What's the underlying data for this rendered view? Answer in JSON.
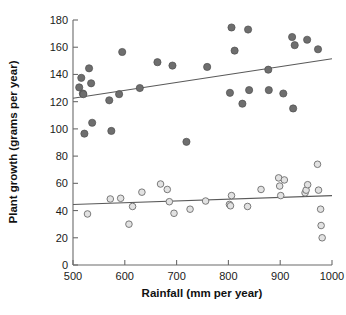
{
  "chart_data": {
    "type": "scatter",
    "title": "",
    "xlabel": "Rainfall (mm per year)",
    "ylabel": "Plant growth (grams per year)",
    "xlim": [
      500,
      1000
    ],
    "ylim": [
      0,
      180
    ],
    "xticks": [
      500,
      600,
      700,
      800,
      900,
      1000
    ],
    "yticks": [
      0,
      20,
      40,
      60,
      80,
      100,
      120,
      140,
      160,
      180
    ],
    "grid": false,
    "legend": "none",
    "series": [
      {
        "name": "filled-circles-upper-group",
        "marker": "filled circle",
        "color": "#6e6e6e",
        "points": [
          [
            512,
            130.5
          ],
          [
            516,
            137.5
          ],
          [
            519,
            126.0
          ],
          [
            520,
            125.5
          ],
          [
            522,
            96.5
          ],
          [
            531,
            144.5
          ],
          [
            535,
            133.5
          ],
          [
            537,
            104.5
          ],
          [
            570,
            121.0
          ],
          [
            574,
            98.5
          ],
          [
            589,
            125.5
          ],
          [
            595,
            156.5
          ],
          [
            629,
            130.0
          ],
          [
            663,
            149.0
          ],
          [
            692,
            146.5
          ],
          [
            719,
            90.5
          ],
          [
            759,
            145.5
          ],
          [
            803,
            126.5
          ],
          [
            806,
            174.5
          ],
          [
            812,
            157.5
          ],
          [
            827,
            118.5
          ],
          [
            838,
            173.0
          ],
          [
            840,
            128.5
          ],
          [
            877,
            143.5
          ],
          [
            878,
            128.5
          ],
          [
            906,
            126.0
          ],
          [
            923,
            167.5
          ],
          [
            925,
            115.0
          ],
          [
            928,
            161.5
          ],
          [
            952,
            165.5
          ],
          [
            973,
            158.5
          ]
        ],
        "trendline": {
          "x": [
            500,
            1000
          ],
          "y": [
            122.5,
            151.5
          ]
        }
      },
      {
        "name": "open-circles-lower-group",
        "marker": "open circle",
        "color": "#e2e2e2",
        "points": [
          [
            528,
            37.5
          ],
          [
            572,
            48.5
          ],
          [
            592,
            49.0
          ],
          [
            608,
            30.0
          ],
          [
            615,
            43.0
          ],
          [
            633,
            53.5
          ],
          [
            669,
            59.5
          ],
          [
            682,
            55.5
          ],
          [
            686,
            46.5
          ],
          [
            695,
            38.0
          ],
          [
            726,
            41.0
          ],
          [
            756,
            47.0
          ],
          [
            802,
            44.5
          ],
          [
            804,
            43.5
          ],
          [
            806,
            51.0
          ],
          [
            837,
            43.0
          ],
          [
            863,
            55.5
          ],
          [
            897,
            64.0
          ],
          [
            899,
            58.0
          ],
          [
            901,
            51.0
          ],
          [
            908,
            62.5
          ],
          [
            948,
            53.0
          ],
          [
            950,
            55.0
          ],
          [
            953,
            59.0
          ],
          [
            972,
            74.0
          ],
          [
            974,
            55.0
          ],
          [
            978,
            41.0
          ],
          [
            979,
            29.0
          ],
          [
            981,
            20.0
          ]
        ],
        "trendline": {
          "x": [
            500,
            1000
          ],
          "y": [
            44.5,
            51.0
          ]
        }
      }
    ]
  },
  "axes": {
    "x_tick_labels": [
      "500",
      "600",
      "700",
      "800",
      "900",
      "1000"
    ],
    "y_tick_labels": [
      "0",
      "20",
      "40",
      "60",
      "80",
      "100",
      "120",
      "140",
      "160",
      "180"
    ],
    "x_axis_title": "Rainfall (mm per year)",
    "y_axis_title": "Plant growth (grams per year)"
  }
}
